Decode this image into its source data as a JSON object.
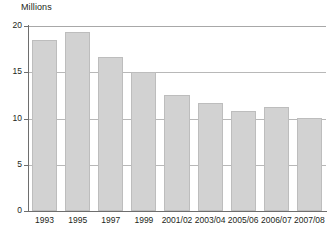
{
  "chart_data": {
    "type": "bar",
    "title": "",
    "subtitle": "",
    "ylabel": "Millions",
    "xlabel": "",
    "ylim": [
      0,
      20
    ],
    "yticks": [
      0,
      5,
      10,
      15,
      20
    ],
    "ytick_labels": [
      "0",
      "5",
      "10",
      "15",
      "20"
    ],
    "grid": true,
    "grid_axis": "y",
    "legend": false,
    "legend_position": "none",
    "categories": [
      "1993",
      "1995",
      "1997",
      "1999",
      "2001/02",
      "2003/04",
      "2005/06",
      "2006/07",
      "2007/08"
    ],
    "values": [
      18.5,
      19.4,
      16.6,
      15.0,
      12.5,
      11.7,
      10.85,
      11.25,
      10.1
    ],
    "bar_color": "#d2d2d2",
    "bar_edge_color": "#bdbdbd",
    "axis_color": "#6e6e6e",
    "grid_color": "#b8b8b8",
    "text_color": "#231f20",
    "background": "#ffffff"
  }
}
